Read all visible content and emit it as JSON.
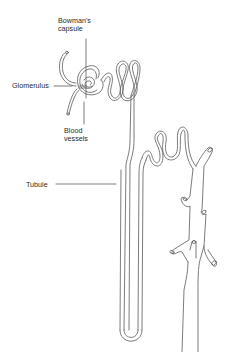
{
  "diagram": {
    "type": "anatomical line drawing",
    "stroke_color": "#555555",
    "background": "#ffffff",
    "labels": [
      {
        "id": "bowmans_capsule",
        "text_line1": "Bowman's",
        "text_line2": "capsule"
      },
      {
        "id": "glomerulus",
        "text": "Glomerulus"
      },
      {
        "id": "blood_vessels",
        "text_line1": "Blood",
        "text_line2": "vessels"
      },
      {
        "id": "tubule",
        "text": "Tubule"
      }
    ]
  }
}
